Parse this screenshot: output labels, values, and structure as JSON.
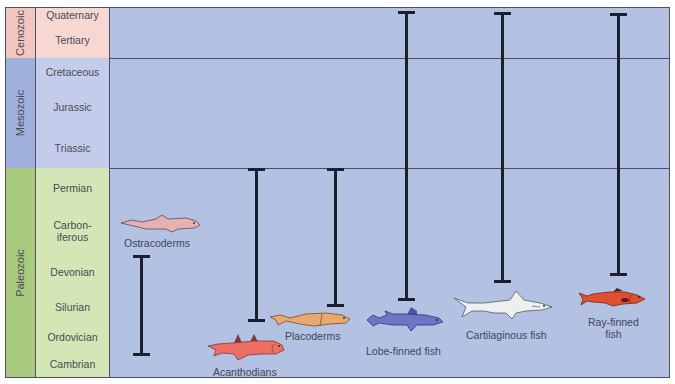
{
  "diagram": {
    "type": "geologic-timeline",
    "eras": [
      {
        "name": "Cenozoic",
        "color": "#f3c6c2",
        "periods": [
          "Quaternary",
          "Tertiary"
        ]
      },
      {
        "name": "Mesozoic",
        "color": "#9fb0dd",
        "periods": [
          "Cretaceous",
          "Jurassic",
          "Triassic"
        ]
      },
      {
        "name": "Paleozoic",
        "color": "#a9c97f",
        "periods": [
          "Permian",
          "Carbon-\niferous",
          "Devonian",
          "Silurian",
          "Ordovician",
          "Cambrian"
        ]
      }
    ],
    "period_colors": {
      "cenozoic": "#f6d7d2",
      "mesozoic": "#c3cdeb",
      "paleozoic": "#d4e6b5"
    },
    "chart_background": "#b3c1e3",
    "fish_groups": [
      {
        "name": "Ostracoderms",
        "range_start": "Ordovician",
        "range_end": "Devonian",
        "color": "#e6b2b0"
      },
      {
        "name": "Acanthodians",
        "range_start": "Silurian",
        "range_end": "Permian",
        "color": "#ef6e64"
      },
      {
        "name": "Placoderms",
        "range_start": "Silurian",
        "range_end": "Permian",
        "color": "#e9a86c"
      },
      {
        "name": "Lobe-finned fish",
        "range_start": "Devonian",
        "range_end": "Quaternary",
        "color": "#6a76c6"
      },
      {
        "name": "Cartilaginous fish",
        "range_start": "Devonian",
        "range_end": "Quaternary",
        "color": "#eeeff0"
      },
      {
        "name": "Ray-finned fish",
        "label_lines": [
          "Ray-finned",
          "fish"
        ],
        "range_start": "Devonian",
        "range_end": "Quaternary",
        "color": "#e0502f"
      }
    ]
  }
}
